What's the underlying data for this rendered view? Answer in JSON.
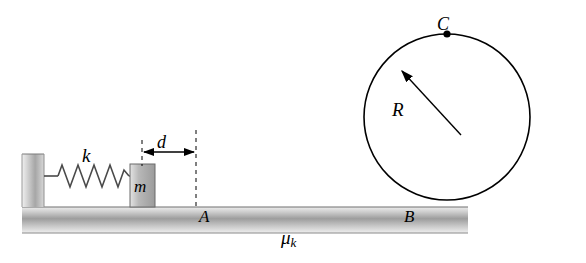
{
  "diagram": {
    "labels": {
      "spring_constant": "k",
      "compression": "d",
      "mass": "m",
      "point_a": "A",
      "point_b": "B",
      "point_c": "C",
      "radius": "R",
      "friction_symbol": "μ",
      "friction_subscript": "k"
    },
    "colors": {
      "outline": "#000000",
      "ground_light": "#d9d9d9",
      "ground_dark": "#8c8c8c",
      "wall_light": "#e2e2e2",
      "wall_dark": "#9a9a9a",
      "block_fill": "#b3b3b3",
      "background": "#ffffff"
    },
    "geometry": {
      "circle_center_x": 447,
      "circle_center_y": 117,
      "circle_radius": 83,
      "point_c_x": 447,
      "point_c_y": 34,
      "ground_top_y": 207,
      "ground_bottom_y": 233,
      "wall_x": 22,
      "block_x": 130,
      "dashed_left_x": 142,
      "dashed_right_x": 196
    }
  }
}
